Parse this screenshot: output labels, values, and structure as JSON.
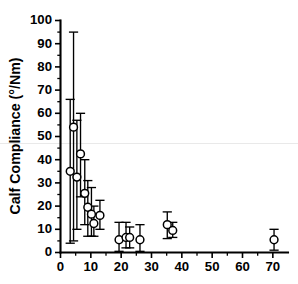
{
  "chart_data": {
    "type": "scatter",
    "title": "",
    "subtitle": "",
    "xlabel": "",
    "ylabel": "Calf Compliance (°/Nm)",
    "xlim": [
      0,
      75
    ],
    "ylim": [
      0,
      100
    ],
    "xticks": [
      0,
      10,
      20,
      30,
      40,
      50,
      60,
      70
    ],
    "yticks": [
      0,
      10,
      20,
      30,
      40,
      50,
      60,
      70,
      80,
      90,
      100
    ],
    "xtick_labels": [
      "0",
      "10",
      "20",
      "30",
      "40",
      "50",
      "60",
      "70"
    ],
    "ytick_labels": [
      "0",
      "10",
      "20",
      "30",
      "40",
      "50",
      "60",
      "70",
      "80",
      "90",
      "100"
    ],
    "x_minor_step": 5,
    "y_minor_step": 5,
    "grid": false,
    "legend": null,
    "marker_style": "open-circle",
    "error_bars": "vertical",
    "annotations": [],
    "points": [
      {
        "x": 3.2,
        "y": 35.0,
        "yerr_low": 31.0,
        "yerr_high": 31.0
      },
      {
        "x": 4.3,
        "y": 54.0,
        "yerr_low": 49.0,
        "yerr_high": 41.0
      },
      {
        "x": 5.4,
        "y": 32.5,
        "yerr_low": 22.5,
        "yerr_high": 24.5
      },
      {
        "x": 6.6,
        "y": 42.5,
        "yerr_low": 18.5,
        "yerr_high": 17.5
      },
      {
        "x": 8.0,
        "y": 25.5,
        "yerr_low": 13.5,
        "yerr_high": 14.5
      },
      {
        "x": 9.0,
        "y": 19.5,
        "yerr_low": 12.5,
        "yerr_high": 11.5
      },
      {
        "x": 10.2,
        "y": 16.5,
        "yerr_low": 9.5,
        "yerr_high": 11.5
      },
      {
        "x": 11.0,
        "y": 12.5,
        "yerr_low": 5.5,
        "yerr_high": 7.5
      },
      {
        "x": 13.0,
        "y": 16.0,
        "yerr_low": 6.0,
        "yerr_high": 6.5
      },
      {
        "x": 19.3,
        "y": 5.5,
        "yerr_low": 5.0,
        "yerr_high": 7.5
      },
      {
        "x": 21.6,
        "y": 6.5,
        "yerr_low": 4.5,
        "yerr_high": 6.5
      },
      {
        "x": 22.8,
        "y": 6.5,
        "yerr_low": 4.5,
        "yerr_high": 4.5
      },
      {
        "x": 26.2,
        "y": 5.5,
        "yerr_low": 5.0,
        "yerr_high": 6.5
      },
      {
        "x": 35.2,
        "y": 12.0,
        "yerr_low": 6.0,
        "yerr_high": 5.5
      },
      {
        "x": 37.0,
        "y": 9.5,
        "yerr_low": 3.0,
        "yerr_high": 3.5
      },
      {
        "x": 70.4,
        "y": 5.5,
        "yerr_low": 4.5,
        "yerr_high": 4.5
      }
    ]
  }
}
